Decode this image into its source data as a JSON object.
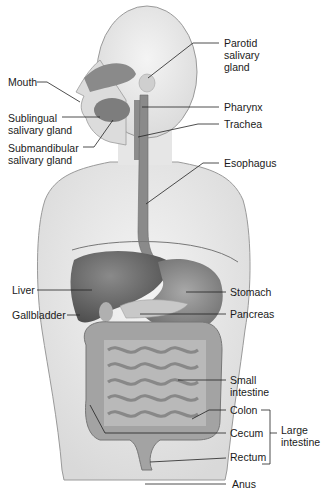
{
  "figure": {
    "labels": [
      {
        "id": "parotid",
        "text": "Parotid\nsalivary\ngland"
      },
      {
        "id": "mouth",
        "text": "Mouth"
      },
      {
        "id": "pharynx",
        "text": "Pharynx"
      },
      {
        "id": "sublingual",
        "text": "Sublingual\nsalivary gland"
      },
      {
        "id": "trachea",
        "text": "Trachea"
      },
      {
        "id": "submandibular",
        "text": "Submandibular\nsalivary gland"
      },
      {
        "id": "esophagus",
        "text": "Esophagus"
      },
      {
        "id": "liver",
        "text": "Liver"
      },
      {
        "id": "stomach",
        "text": "Stomach"
      },
      {
        "id": "gallbladder",
        "text": "Gallbladder"
      },
      {
        "id": "pancreas",
        "text": "Pancreas"
      },
      {
        "id": "small_intestine",
        "text": "Small\nintestine"
      },
      {
        "id": "colon",
        "text": "Colon"
      },
      {
        "id": "cecum",
        "text": "Cecum"
      },
      {
        "id": "rectum",
        "text": "Rectum"
      },
      {
        "id": "large_intestine",
        "text": "Large\nintestine"
      },
      {
        "id": "anus",
        "text": "Anus"
      }
    ]
  },
  "colors": {
    "skin": "#ebebeb",
    "outline": "#8a8a8a",
    "organ_dark": "#6e6e6e",
    "organ_mid": "#9a9a9a",
    "organ_light": "#c4c4c4",
    "line": "#222222"
  }
}
